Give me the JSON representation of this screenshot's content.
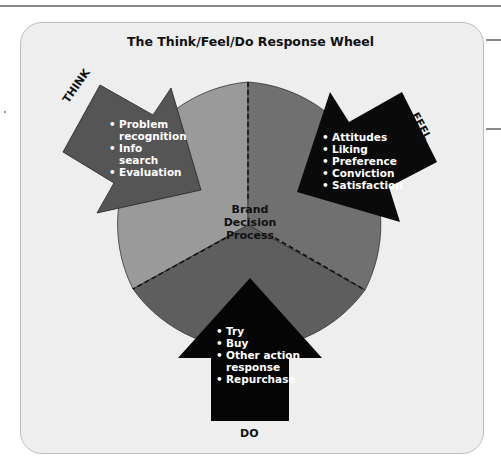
{
  "title": "The Think/Feel/Do Response Wheel",
  "center_label": [
    "Brand",
    "Decision",
    "Process"
  ],
  "segments": {
    "think": {
      "label": "THINK",
      "wedge_color": "#9a9a9a",
      "arrow_color": "#555555",
      "items": [
        "Problem recognition",
        "Info search",
        "Evaluation"
      ],
      "lines": [
        "Problem",
        "recognition",
        "Info",
        "search",
        "Evaluation"
      ]
    },
    "feel": {
      "label": "FEEL",
      "wedge_color": "#707070",
      "arrow_color": "#0a0a0a",
      "items": [
        "Attitudes",
        "Liking",
        "Preference",
        "Conviction",
        "Satisfaction"
      ]
    },
    "do": {
      "label": "DO",
      "wedge_color": "#5e5e5e",
      "arrow_color": "#050505",
      "items": [
        "Try",
        "Buy",
        "Other action response",
        "Repurchase"
      ],
      "lines": [
        "Try",
        "Buy",
        "Other action",
        "response",
        "Repurchase"
      ]
    }
  },
  "colors": {
    "card_bg": "#eeeeee",
    "card_border": "#bdbdbd",
    "divider": "#111111"
  }
}
